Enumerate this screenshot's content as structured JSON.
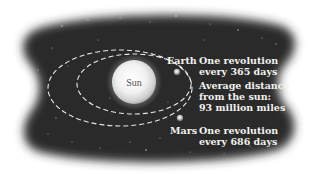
{
  "diagram": {
    "sun": {
      "label": "Sun"
    },
    "earth": {
      "label": "Earth",
      "revolution_line1": "One revolution",
      "revolution_line2": "every 365 days",
      "distance_line1": "Average distance",
      "distance_line2": "from the sun:",
      "distance_line3": "93 million miles"
    },
    "mars": {
      "label": "Mars",
      "revolution_line1": "One revolution",
      "revolution_line2": "every 686 days"
    },
    "colors": {
      "background": "#ffffff",
      "space": "#2b2b2b",
      "orbit": "#e8e8e8",
      "text": "#f2f2ee",
      "sun_core": "#ffffff",
      "sun_edge": "#c9c9c9"
    }
  }
}
